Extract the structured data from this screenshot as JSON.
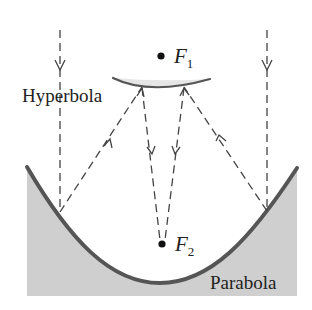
{
  "diagram": {
    "labels": {
      "hyperbola": "Hyperbola",
      "parabola": "Parabola",
      "focus1_main": "F",
      "focus1_sub": "1",
      "focus2_main": "F",
      "focus2_sub": "2"
    },
    "colors": {
      "background": "#ffffff",
      "curve_stroke": "#555555",
      "fill_shade": "#cfcfcf",
      "hyperbola_fill": "#e6e6e6",
      "ray_stroke": "#444444",
      "text": "#222222",
      "focus_dot": "#111111"
    },
    "elements": [
      {
        "id": "parabola-mirror",
        "type": "curve",
        "description": "Primary parabolic mirror with shaded body below"
      },
      {
        "id": "hyperbola-mirror",
        "type": "curve",
        "description": "Secondary hyperbolic mirror near F1"
      },
      {
        "id": "focus-1",
        "type": "point",
        "label": "F1"
      },
      {
        "id": "focus-2",
        "type": "point",
        "label": "F2"
      },
      {
        "id": "incoming-rays",
        "type": "dashed-arrows",
        "count": 2
      },
      {
        "id": "reflected-rays-to-hyperbola",
        "type": "dashed-arrows",
        "count": 2
      },
      {
        "id": "rays-to-F2",
        "type": "dashed-arrows",
        "count": 2
      }
    ]
  }
}
